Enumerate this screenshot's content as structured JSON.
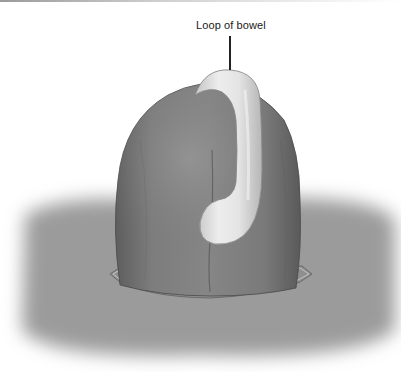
{
  "figure": {
    "type": "medical-illustration",
    "labels": [
      {
        "text": "Loop of bowel",
        "target": "white tubular loop encircling organ"
      }
    ]
  },
  "colors": {
    "background": "#ffffff",
    "skin_surface": "#9a9a9a",
    "organ_body": "#7a7a7a",
    "organ_shadow": "#555555",
    "bowel_loop": "#e6e6e6",
    "bowel_loop_shade": "#bdbdbd",
    "leader_line": "#222222",
    "label_text": "#1a1a1a"
  }
}
